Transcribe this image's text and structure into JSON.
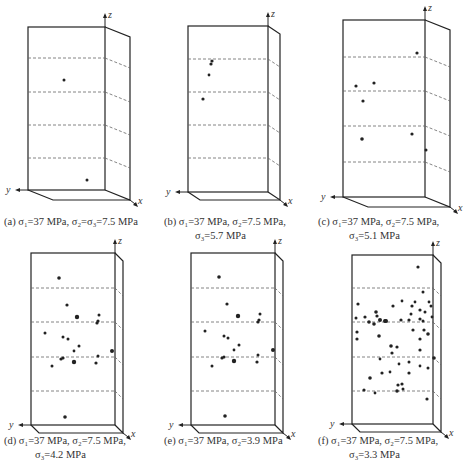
{
  "figure": {
    "panels": [
      {
        "id": "a",
        "caption_line1": "(a) σ₁=37 MPa, σ₂=σ₃=7.5 MPa",
        "caption_line2": "",
        "sigma1": "37 MPa",
        "sigma2": "7.5 MPa",
        "sigma3": "7.5 MPa",
        "box": {
          "x0": 28,
          "y0": 27,
          "x1": 105,
          "y1": 190,
          "dx": 25,
          "dy": 10
        },
        "dashes": [
          58,
          92,
          125,
          158
        ],
        "points": [
          [
            64,
            80,
            1.5
          ],
          [
            87,
            180,
            1.5
          ]
        ]
      },
      {
        "id": "b",
        "caption_line1": "(b) σ₁=37 MPa, σ₂=7.5 MPa,",
        "caption_line2": "σ₃=5.7 MPa",
        "sigma1": "37 MPa",
        "sigma2": "7.5 MPa",
        "sigma3": "5.7 MPa",
        "box": {
          "x0": 188,
          "y0": 26,
          "x1": 268,
          "y1": 192,
          "dx": 12,
          "dy": 8
        },
        "dashes": [
          59,
          92,
          125,
          158
        ],
        "points": [
          [
            212,
            61,
            1.6
          ],
          [
            211,
            64,
            1.6
          ],
          [
            209,
            75,
            1.4
          ],
          [
            203,
            99,
            1.6
          ]
        ]
      },
      {
        "id": "c",
        "caption_line1": "(c) σ₁=37 MPa, σ₂=7.5 MPa,",
        "caption_line2": "σ₃=5.1 MPa",
        "sigma1": "37 MPa",
        "sigma2": "7.5 MPa",
        "sigma3": "5.1 MPa",
        "box": {
          "x0": 343,
          "y0": 20,
          "x1": 425,
          "y1": 197,
          "dx": 25,
          "dy": 10
        },
        "dashes": [
          57,
          91,
          126,
          162
        ],
        "points": [
          [
            417,
            53,
            1.6
          ],
          [
            356,
            86,
            1.6
          ],
          [
            374,
            83,
            1.6
          ],
          [
            363,
            101,
            1.6
          ],
          [
            362,
            139,
            1.8
          ],
          [
            412,
            134,
            1.6
          ],
          [
            426,
            150,
            1.5
          ]
        ]
      },
      {
        "id": "d",
        "caption_line1": "(d) σ₁=37 MPa, σ₂=7.5 MPa,",
        "caption_line2": "σ₃=4.2 MPa",
        "sigma1": "37 MPa",
        "sigma2": "7.5 MPa",
        "sigma3": "4.2 MPa",
        "box": {
          "x0": 31,
          "y0": 253,
          "x1": 115,
          "y1": 425,
          "dx": 8,
          "dy": 8
        },
        "dashes": [
          288,
          322,
          357,
          391
        ],
        "points": [
          [
            59,
            278,
            1.8
          ],
          [
            67,
            305,
            1.6
          ],
          [
            77,
            317,
            2.2
          ],
          [
            99,
            315,
            1.5
          ],
          [
            98,
            321,
            1.6
          ],
          [
            97,
            323,
            1.6
          ],
          [
            45,
            333,
            1.5
          ],
          [
            63,
            337,
            1.5
          ],
          [
            68,
            339,
            1.5
          ],
          [
            79,
            346,
            1.5
          ],
          [
            74,
            351,
            1.4
          ],
          [
            112,
            351,
            2
          ],
          [
            98,
            356,
            1.5
          ],
          [
            61,
            359,
            1.6
          ],
          [
            63,
            358,
            1.6
          ],
          [
            74,
            362,
            2.2
          ],
          [
            96,
            363,
            1.6
          ],
          [
            52,
            366,
            1.5
          ],
          [
            65,
            417,
            1.8
          ]
        ]
      },
      {
        "id": "e",
        "caption_line1": "(e) σ₁=37 MPa, σ₂=3.9 MPa",
        "caption_line2": "",
        "sigma1": "37 MPa",
        "sigma2": "3.9 MPa",
        "box": {
          "x0": 191,
          "y0": 253,
          "x1": 275,
          "y1": 425,
          "dx": 8,
          "dy": 8
        },
        "dashes": [
          288,
          322,
          357,
          391
        ],
        "points": [
          [
            219,
            277,
            1.8
          ],
          [
            227,
            304,
            1.6
          ],
          [
            238,
            316,
            2.2
          ],
          [
            260,
            314,
            1.5
          ],
          [
            259,
            320,
            1.6
          ],
          [
            258,
            322,
            1.6
          ],
          [
            205,
            331,
            1.5
          ],
          [
            224,
            336,
            1.5
          ],
          [
            228,
            338,
            1.5
          ],
          [
            239,
            345,
            1.5
          ],
          [
            234,
            350,
            1.4
          ],
          [
            273,
            350,
            2
          ],
          [
            258,
            355,
            1.5
          ],
          [
            222,
            358,
            1.6
          ],
          [
            224,
            357,
            1.6
          ],
          [
            234,
            361,
            2.2
          ],
          [
            257,
            362,
            1.6
          ],
          [
            212,
            366,
            1.5
          ],
          [
            225,
            416,
            1.8
          ]
        ]
      },
      {
        "id": "f",
        "caption_line1": "(f) σ₁=37 MPa, σ₂=7.5 MPa,",
        "caption_line2": "σ₃=3.3 MPa",
        "sigma1": "37 MPa",
        "sigma2": "7.5 MPa",
        "sigma3": "3.3 MPa",
        "box": {
          "x0": 352,
          "y0": 255,
          "x1": 433,
          "y1": 424,
          "dx": 8,
          "dy": 8
        },
        "dashes": [
          288,
          322,
          357,
          391
        ],
        "points": [
          [
            418,
            267,
            1.6
          ],
          [
            423,
            292,
            1.5
          ],
          [
            358,
            304,
            1.6
          ],
          [
            402,
            301,
            1.4
          ],
          [
            393,
            306,
            1.6
          ],
          [
            412,
            306,
            1.6
          ],
          [
            415,
            302,
            1.4
          ],
          [
            429,
            302,
            1.4
          ],
          [
            431,
            306,
            1.5
          ],
          [
            376,
            312,
            1.8
          ],
          [
            420,
            310,
            1.6
          ],
          [
            411,
            314,
            1.5
          ],
          [
            425,
            312,
            1.5
          ],
          [
            356,
            318,
            1.5
          ],
          [
            365,
            317,
            1.6
          ],
          [
            377,
            316,
            1.6
          ],
          [
            369,
            322,
            1.8
          ],
          [
            380,
            320,
            2
          ],
          [
            385,
            321,
            2
          ],
          [
            386,
            321,
            2
          ],
          [
            401,
            320,
            1.6
          ],
          [
            409,
            320,
            1.6
          ],
          [
            420,
            319,
            1.6
          ],
          [
            423,
            321,
            1.5
          ],
          [
            432,
            317,
            1.4
          ],
          [
            374,
            324,
            1.8
          ],
          [
            357,
            332,
            1.6
          ],
          [
            413,
            330,
            1.6
          ],
          [
            424,
            330,
            1.6
          ],
          [
            428,
            334,
            1.8
          ],
          [
            357,
            339,
            1.6
          ],
          [
            379,
            336,
            1.8
          ],
          [
            420,
            339,
            1.6
          ],
          [
            391,
            346,
            1.8
          ],
          [
            397,
            347,
            1.6
          ],
          [
            392,
            353,
            1.6
          ],
          [
            420,
            350,
            1.6
          ],
          [
            434,
            358,
            1.8
          ],
          [
            380,
            359,
            1.4
          ],
          [
            409,
            362,
            1.5
          ],
          [
            399,
            364,
            1.4
          ],
          [
            420,
            366,
            1.4
          ],
          [
            428,
            368,
            1.5
          ],
          [
            382,
            373,
            1.6
          ],
          [
            390,
            372,
            1.4
          ],
          [
            409,
            373,
            1.6
          ],
          [
            370,
            378,
            1.8
          ],
          [
            398,
            385,
            1.6
          ],
          [
            402,
            384,
            1.6
          ],
          [
            403,
            389,
            1.5
          ],
          [
            397,
            391,
            1.8
          ],
          [
            364,
            390,
            1.6
          ],
          [
            375,
            393,
            1.4
          ],
          [
            427,
            399,
            1.6
          ]
        ]
      }
    ],
    "axis_labels": {
      "x": "x",
      "y": "y",
      "z": "z"
    },
    "colors": {
      "line": "#222222",
      "dash": "#666666",
      "point": "#222222",
      "background": "#ffffff"
    }
  }
}
